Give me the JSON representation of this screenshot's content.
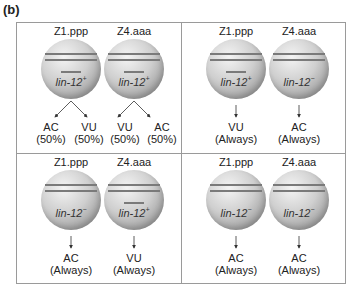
{
  "panel_label": "(b)",
  "quadrants": [
    {
      "cells": [
        {
          "name": "Z1.ppp",
          "gene": "lin-12",
          "allele": "+",
          "has_mark": true
        },
        {
          "name": "Z4.aaa",
          "gene": "lin-12",
          "allele": "+",
          "has_mark": true
        }
      ],
      "outcomes": [
        {
          "fate": "AC",
          "freq": "(50%)"
        },
        {
          "fate": "VU",
          "freq": "(50%)"
        },
        {
          "fate": "VU",
          "freq": "(50%)"
        },
        {
          "fate": "AC",
          "freq": "(50%)"
        }
      ]
    },
    {
      "cells": [
        {
          "name": "Z1.ppp",
          "gene": "lin-12",
          "allele": "+",
          "has_mark": true
        },
        {
          "name": "Z4.aaa",
          "gene": "lin-12",
          "allele": "−",
          "has_mark": false
        }
      ],
      "outcomes": [
        {
          "fate": "VU",
          "freq": "(Always)"
        },
        {
          "fate": "AC",
          "freq": "(Always)"
        }
      ]
    },
    {
      "cells": [
        {
          "name": "Z1.ppp",
          "gene": "lin-12",
          "allele": "−",
          "has_mark": false
        },
        {
          "name": "Z4.aaa",
          "gene": "lin-12",
          "allele": "+",
          "has_mark": true
        }
      ],
      "outcomes": [
        {
          "fate": "AC",
          "freq": "(Always)"
        },
        {
          "fate": "VU",
          "freq": "(Always)"
        }
      ]
    },
    {
      "cells": [
        {
          "name": "Z1.ppp",
          "gene": "lin-12",
          "allele": "−",
          "has_mark": false
        },
        {
          "name": "Z4.aaa",
          "gene": "lin-12",
          "allele": "−",
          "has_mark": false
        }
      ],
      "outcomes": [
        {
          "fate": "AC",
          "freq": "(Always)"
        },
        {
          "fate": "AC",
          "freq": "(Always)"
        }
      ]
    }
  ]
}
